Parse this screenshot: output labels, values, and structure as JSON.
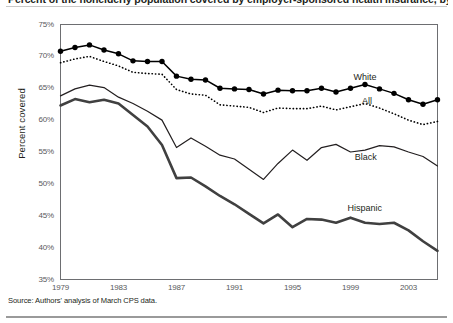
{
  "figure": {
    "title": "Percent of the nonelderly population covered by employer-sponsored health insurance, by race and ethnicity",
    "source_note": "Source: Authors' analysis of March CPS data.",
    "ylabel": "Percent covered"
  },
  "chart_data": {
    "type": "line",
    "title": "Percent of the nonelderly population covered by employer-sponsored health insurance, by race and ethnicity",
    "xlabel": "",
    "ylabel": "Percent covered",
    "xlim": [
      1979,
      2005
    ],
    "ylim": [
      35,
      75
    ],
    "ytick_labels": [
      "75%",
      "70%",
      "65%",
      "60%",
      "55%",
      "50%",
      "45%",
      "40%",
      "35%"
    ],
    "ytick_values": [
      75,
      70,
      65,
      60,
      55,
      50,
      45,
      40,
      35
    ],
    "xtick_labels": [
      "1979",
      "1983",
      "1987",
      "1991",
      "1995",
      "1999",
      "2003"
    ],
    "xtick_values": [
      1979,
      1983,
      1987,
      1991,
      1995,
      1999,
      2003
    ],
    "grid": false,
    "legend_position": "inline-annotations",
    "x": [
      1979,
      1980,
      1981,
      1982,
      1983,
      1984,
      1985,
      1986,
      1987,
      1988,
      1989,
      1990,
      1991,
      1992,
      1993,
      1994,
      1995,
      1996,
      1997,
      1998,
      1999,
      2000,
      2001,
      2002,
      2003,
      2004,
      2005
    ],
    "series": [
      {
        "name": "White",
        "style": "solid-with-markers",
        "color": "#000000",
        "values": [
          70.8,
          71.4,
          71.8,
          71.0,
          70.4,
          69.3,
          69.2,
          69.2,
          66.9,
          66.4,
          66.3,
          65.0,
          64.9,
          64.8,
          64.1,
          64.7,
          64.6,
          64.6,
          65.0,
          64.4,
          65.0,
          65.6,
          64.9,
          64.2,
          63.2,
          62.5,
          63.2
        ]
      },
      {
        "name": "All",
        "style": "dotted",
        "color": "#000000",
        "values": [
          69.0,
          69.6,
          70.0,
          69.2,
          68.5,
          67.5,
          67.3,
          67.2,
          64.8,
          64.1,
          63.9,
          62.4,
          62.2,
          62.0,
          61.2,
          61.9,
          61.8,
          61.8,
          62.2,
          61.6,
          62.1,
          62.6,
          61.9,
          61.0,
          60.0,
          59.3,
          59.8
        ]
      },
      {
        "name": "Black",
        "style": "thin-solid",
        "color": "#231f20",
        "values": [
          63.8,
          64.9,
          65.5,
          65.1,
          63.6,
          62.6,
          61.4,
          60.0,
          55.7,
          57.2,
          55.9,
          54.5,
          53.9,
          52.3,
          50.7,
          53.2,
          55.3,
          53.7,
          55.7,
          56.2,
          55.0,
          55.3,
          56.0,
          55.8,
          55.0,
          54.3,
          52.8
        ]
      },
      {
        "name": "Hispanic",
        "style": "thick-solid",
        "color": "#404040",
        "values": [
          62.3,
          63.3,
          62.8,
          63.2,
          62.6,
          60.8,
          59.0,
          56.1,
          50.9,
          51.0,
          49.6,
          48.1,
          46.8,
          45.3,
          43.8,
          45.2,
          43.2,
          44.5,
          44.4,
          43.9,
          44.7,
          43.9,
          43.7,
          43.9,
          42.7,
          41.0,
          39.5
        ]
      }
    ],
    "annotations": [
      {
        "text": "White",
        "x": 1999.2,
        "y": 66.6
      },
      {
        "text": "All",
        "x": 1999.8,
        "y": 62.9
      },
      {
        "text": "Black",
        "x": 1999.3,
        "y": 54.0
      },
      {
        "text": "Hispanic",
        "x": 1998.8,
        "y": 46.0
      }
    ]
  }
}
